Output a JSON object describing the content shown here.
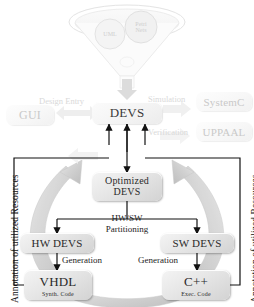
{
  "diagram": {
    "funnel": {
      "sources": [
        {
          "id": "uml",
          "label": "UML"
        },
        {
          "id": "petri",
          "label": "Petri\nNets"
        }
      ]
    },
    "boxes": {
      "gui": {
        "label": "GUI"
      },
      "devs": {
        "label": "DEVS"
      },
      "systemc": {
        "label": "SystemC"
      },
      "uppaal": {
        "label": "UPPAAL"
      },
      "optimized_devs": {
        "label": "Optimized\nDEVS",
        "line1": "Optimized",
        "line2": "DEVS"
      },
      "hw_devs": {
        "label": "HW DEVS"
      },
      "sw_devs": {
        "label": "SW DEVS"
      },
      "vhdl": {
        "label": "VHDL",
        "sub": "Synth. Code"
      },
      "cpp": {
        "label": "C++",
        "sub": "Exec. Code"
      }
    },
    "edge_labels": {
      "design_entry": "Design Entry",
      "simulation": "Simulation",
      "verification": "Verification",
      "hwsw_line1": "HW/SW",
      "hwsw_line2": "Partitioning",
      "generation_left": "Generation",
      "generation_right": "Generation"
    },
    "side_labels": {
      "left": "Annotation of utilized Resources",
      "right": "Annotation of utilized Resources"
    },
    "colors": {
      "box_fill": "#e6e6e6",
      "box_text": "#2a2a2a",
      "faded_text": "#d9d9d9",
      "line": "#111111",
      "gray_arrow": "#d0d0d0",
      "background": "#ffffff"
    }
  }
}
